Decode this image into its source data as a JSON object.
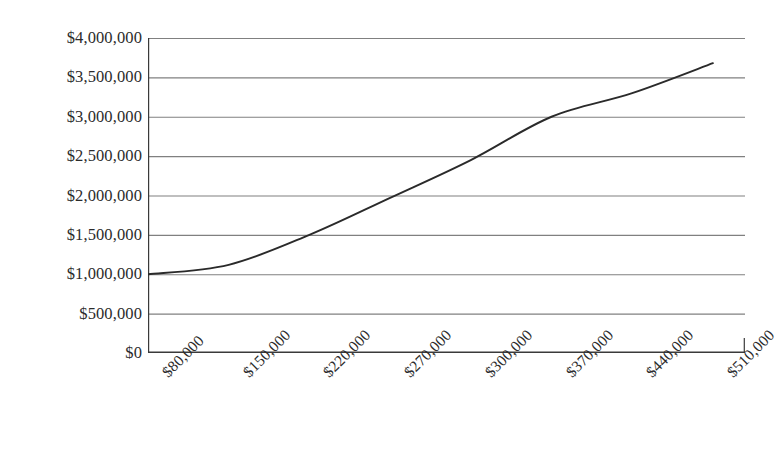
{
  "chart_data": {
    "type": "line",
    "title": "",
    "subtitle": "",
    "xlabel": "",
    "ylabel": "",
    "categories": [
      "$80,000",
      "$150,000",
      "$220,000",
      "$270,000",
      "$300,000",
      "$370,000",
      "$440,000",
      "$510,000"
    ],
    "x_tick_labels": [
      "$80,000",
      "$150,000",
      "$220,000",
      "$270,000",
      "$300,000",
      "$370,000",
      "$440,000",
      "$510,000"
    ],
    "y_tick_labels": [
      "$4,000,000",
      "$3,500,000",
      "$3,000,000",
      "$2,500,000",
      "$2,000,000",
      "$1,500,000",
      "$1,000,000",
      "$500,000",
      "$0"
    ],
    "y_tick_values": [
      4000000,
      3500000,
      3000000,
      2500000,
      2000000,
      1500000,
      1000000,
      500000,
      0
    ],
    "values": [
      1000000,
      1120000,
      1500000,
      1970000,
      2450000,
      3000000,
      3300000,
      3680000
    ],
    "series": [
      {
        "name": "",
        "values": [
          1000000,
          1120000,
          1500000,
          1970000,
          2450000,
          3000000,
          3300000,
          3680000
        ]
      }
    ],
    "ylim": [
      0,
      4000000
    ],
    "y_tick_step": 500000,
    "grid": true,
    "grid_axis": "y",
    "legend": false,
    "legend_position": "none",
    "line_color": "#2a2a2a",
    "grid_color": "#808080",
    "axis_color": "#3a3a3a",
    "background_color": "#ffffff",
    "x_label_rotation": -45,
    "annotations": []
  },
  "axes": {
    "y_ticks": [
      {
        "label": "$4,000,000",
        "value": 4000000
      },
      {
        "label": "$3,500,000",
        "value": 3500000
      },
      {
        "label": "$3,000,000",
        "value": 3000000
      },
      {
        "label": "$2,500,000",
        "value": 2500000
      },
      {
        "label": "$2,000,000",
        "value": 2000000
      },
      {
        "label": "$1,500,000",
        "value": 1500000
      },
      {
        "label": "$1,000,000",
        "value": 1000000
      },
      {
        "label": "$500,000",
        "value": 500000
      },
      {
        "label": "$0",
        "value": 0
      }
    ],
    "x_ticks": [
      {
        "label": "$80,000"
      },
      {
        "label": "$150,000"
      },
      {
        "label": "$220,000"
      },
      {
        "label": "$270,000"
      },
      {
        "label": "$300,000"
      },
      {
        "label": "$370,000"
      },
      {
        "label": "$440,000"
      },
      {
        "label": "$510,000"
      }
    ]
  }
}
